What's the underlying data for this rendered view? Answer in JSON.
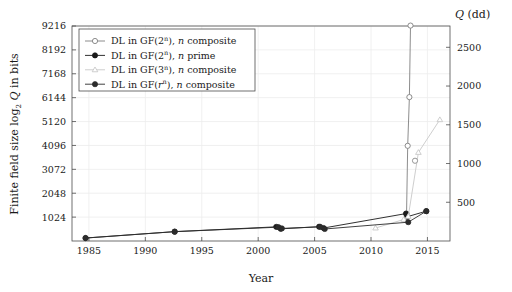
{
  "chart_data": {
    "type": "line",
    "title": "",
    "xlabel": "Year",
    "ylabel": "Finite field size log2 Q in bits",
    "y2label": "Q (dd)",
    "xlim": [
      1983.5,
      2017.0
    ],
    "ylim": [
      0,
      9216
    ],
    "y2lim": [
      0,
      2775
    ],
    "grid": true,
    "legend_position": "top-left",
    "xticks": [
      1985,
      1990,
      1995,
      2000,
      2005,
      2010,
      2015
    ],
    "xticklabels": [
      "1985",
      "1990",
      "1995",
      "2000",
      "2005",
      "2010",
      "2015"
    ],
    "yticks": [
      1024,
      2048,
      3072,
      4096,
      5120,
      6144,
      7168,
      8192,
      9216
    ],
    "yticklabels": [
      "1024",
      "2048",
      "3072",
      "4096",
      "5120",
      "6144",
      "7168",
      "8192",
      "9216"
    ],
    "y2ticks": [
      500,
      1000,
      1500,
      2000,
      2500
    ],
    "y2ticklabels": [
      "500",
      "1000",
      "1500",
      "2000",
      "2500"
    ],
    "series": [
      {
        "name": "DL in GF(2^n), n composite",
        "legend_label_parts": {
          "prefix": "DL in GF(2",
          "sup": "n",
          "mid": "), ",
          "ital": "n",
          "suffix": " composite"
        },
        "marker": "open-circle",
        "color": "#808080",
        "points": [
          {
            "x": 2013.15,
            "y": 1175
          },
          {
            "x": 2013.25,
            "y": 4080
          },
          {
            "x": 2013.4,
            "y": 6168
          },
          {
            "x": 2013.5,
            "y": 9234
          }
        ]
      },
      {
        "name": "DL in GF(2^n), n prime",
        "legend_label_parts": {
          "prefix": "DL in GF(2",
          "sup": "n",
          "mid": "), ",
          "ital": "n",
          "suffix": " prime"
        },
        "marker": "filled-circle",
        "color": "#1a1a1a",
        "points": [
          {
            "x": 1984.7,
            "y": 127
          },
          {
            "x": 1992.6,
            "y": 401
          },
          {
            "x": 2001.6,
            "y": 607
          },
          {
            "x": 2002.0,
            "y": 521
          },
          {
            "x": 2005.4,
            "y": 613
          },
          {
            "x": 2005.8,
            "y": 556
          },
          {
            "x": 2013.1,
            "y": 1175
          },
          {
            "x": 2013.2,
            "y": 1039
          },
          {
            "x": 2014.9,
            "y": 1279
          }
        ]
      },
      {
        "name": "DL in GF(3^n), n composite",
        "legend_label_parts": {
          "prefix": "DL in GF(3",
          "sup": "n",
          "mid": "), ",
          "ital": "n",
          "suffix": " composite"
        },
        "marker": "open-triangle",
        "color": "#c8c8c8",
        "points": [
          {
            "x": 2010.4,
            "y": 556
          },
          {
            "x": 2012.9,
            "y": 923
          },
          {
            "x": 2013.3,
            "y": 1054
          },
          {
            "x": 2014.2,
            "y": 3796
          },
          {
            "x": 2016.1,
            "y": 5199
          }
        ]
      },
      {
        "name": "DL in GF(r^n), n composite",
        "legend_label_parts": {
          "prefix": "DL in GF(",
          "sup_pre_ital": "r",
          "sup": "n",
          "mid": "), ",
          "ital": "n",
          "suffix": " composite"
        },
        "marker": "filled-circle",
        "color": "#2b2b2b",
        "points": [
          {
            "x": 1984.7,
            "y": 127
          },
          {
            "x": 1992.6,
            "y": 401
          },
          {
            "x": 2001.8,
            "y": 593
          },
          {
            "x": 2002.1,
            "y": 540
          },
          {
            "x": 2005.5,
            "y": 607
          },
          {
            "x": 2005.9,
            "y": 515
          },
          {
            "x": 2013.3,
            "y": 806
          },
          {
            "x": 2014.9,
            "y": 1279
          }
        ]
      }
    ],
    "extra_markers": [
      {
        "x": 2013.9,
        "y": 3440,
        "marker": "open-circle",
        "color": "#8c8c8c",
        "series": "DL in GF(2^n), n composite"
      }
    ]
  }
}
